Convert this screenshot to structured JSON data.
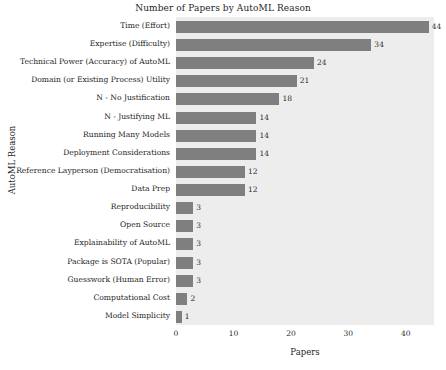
{
  "chart_data": {
    "type": "bar",
    "orientation": "horizontal",
    "title": "Number of Papers by AutoML Reason",
    "xlabel": "Papers",
    "ylabel": "AutoML Reason",
    "xlim": [
      0,
      44.9
    ],
    "xticks": [
      0,
      10,
      20,
      30,
      40
    ],
    "xtick_labels": [
      "0",
      "10",
      "20",
      "30",
      "40"
    ],
    "grid": false,
    "legend": null,
    "bar_color": "#7f7f7f",
    "plot_background": "#ededed",
    "figure_background": "#ffffff",
    "categories": [
      "Time (Effort)",
      "Expertise (Difficulty)",
      "Technical Power (Accuracy) of AutoML",
      "Domain (or Existing Process) Utility",
      "N - No Justification",
      "N - Justifying ML",
      "Running Many Models",
      "Deployment Considerations",
      "Reference Layperson (Democratisation)",
      "Data Prep",
      "Reproducibility",
      "Open Source",
      "Explainability of AutoML",
      "Package is SOTA (Popular)",
      "Guesswork (Human Error)",
      "Computational Cost",
      "Model Simplicity"
    ],
    "values": [
      44,
      34,
      24,
      21,
      18,
      14,
      14,
      14,
      12,
      12,
      3,
      3,
      3,
      3,
      3,
      2,
      1
    ],
    "value_labels": [
      "44",
      "34",
      "24",
      "21",
      "18",
      "14",
      "14",
      "14",
      "12",
      "12",
      "3",
      "3",
      "3",
      "3",
      "3",
      "2",
      "1"
    ]
  }
}
